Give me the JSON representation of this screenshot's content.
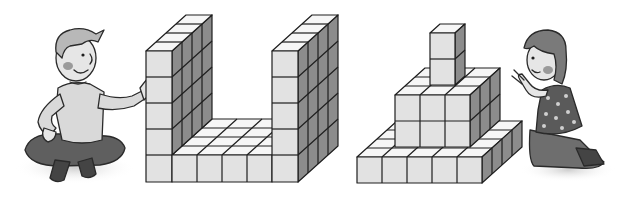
{
  "scene": {
    "description": "Illustration: two children beside cube-block structures",
    "colors": {
      "background": "#ffffff",
      "cube_front": "#e2e2e2",
      "cube_top": "#f6f6f6",
      "cube_side": "#8c8c8c",
      "outline": "#1e1e1e",
      "skin": "#e6e6e6",
      "cheek": "#9a9a9a",
      "boy_shirt": "#d9d9d9",
      "boy_pants": "#5f5f5f",
      "boy_hair": "#b8b8b8",
      "girl_hair": "#7a7a7a",
      "girl_dress": "#5a5a5a",
      "girl_dots": "#cfcfcf",
      "girl_legs": "#6e6e6e"
    },
    "left_figure": {
      "label": "Boy sitting cross-legged, hand on block structure",
      "structure": {
        "label": "U-shaped block structure",
        "front_columns": 6,
        "pillar_height": 5,
        "depth": 4
      }
    },
    "right_figure": {
      "label": "Girl kneeling, counting blocks",
      "structure": {
        "label": "Stepped block pyramid",
        "base_columns": 5,
        "middle_columns": 3,
        "middle_rows": 2,
        "tower_height": 2
      }
    }
  }
}
